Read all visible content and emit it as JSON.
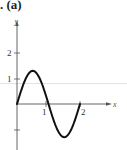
{
  "title": ". (a)",
  "chart_data": {
    "type": "line",
    "title": "(a)",
    "xlabel": "x",
    "ylabel": "y",
    "xlim": [
      0,
      2
    ],
    "ylim": [
      -1.5,
      2.5
    ],
    "x_ticks": [
      1,
      2
    ],
    "x_tick_labels": [
      "1",
      "2"
    ],
    "y_ticks": [
      2,
      1,
      -1
    ],
    "y_tick_labels": [
      "2",
      "1",
      ""
    ],
    "grid": false,
    "series": [
      {
        "name": "curve",
        "x": [
          0,
          0.25,
          0.5,
          0.75,
          1.0,
          1.25,
          1.5,
          1.75,
          2.0
        ],
        "values": [
          0,
          0.92,
          1.3,
          0.92,
          0,
          -0.92,
          -1.3,
          -0.92,
          0
        ]
      }
    ]
  }
}
